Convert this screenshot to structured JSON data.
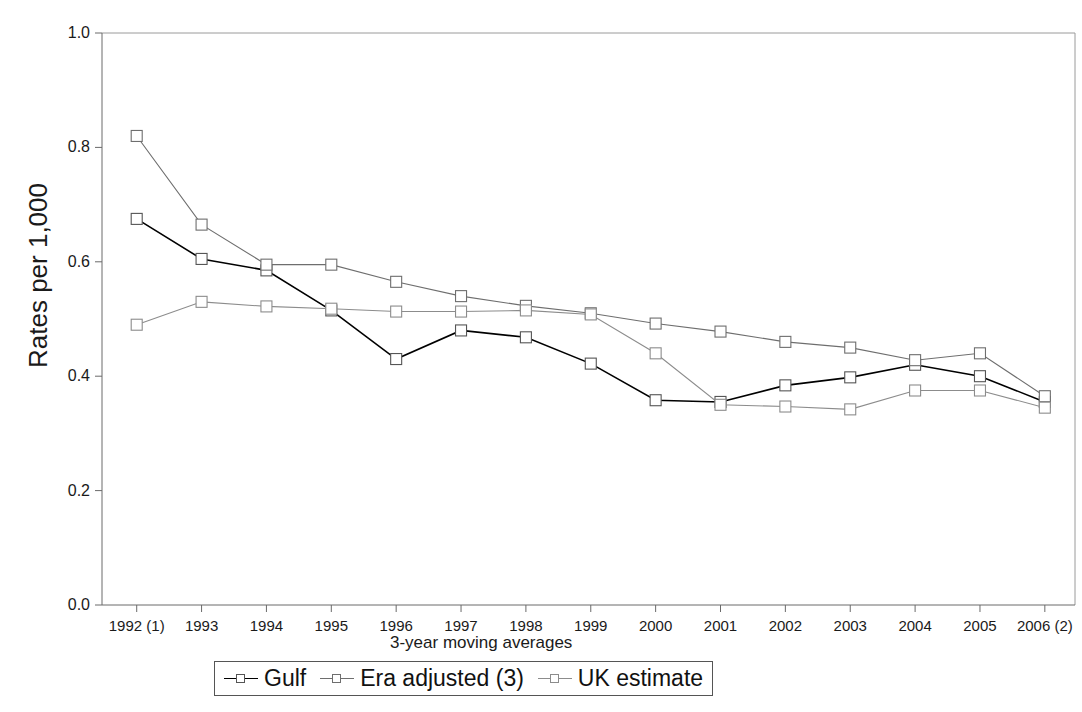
{
  "axes": {
    "ylabel": "Rates per 1,000",
    "xlabel": "3-year moving averages",
    "ytick_labels": [
      "1.0",
      "0.8",
      "0.6",
      "0.4",
      "0.2",
      "0.0"
    ],
    "xtick_labels": [
      "1992 (1)",
      "1993",
      "1994",
      "1995",
      "1996",
      "1997",
      "1998",
      "1999",
      "2000",
      "2001",
      "2002",
      "2003",
      "2004",
      "2005",
      "2006 (2)"
    ]
  },
  "legend": {
    "entries": [
      {
        "label": "Gulf",
        "color": "#000000"
      },
      {
        "label": "Era adjusted (3)",
        "color": "#6e6e6e"
      },
      {
        "label": "UK estimate",
        "color": "#8c8c8c"
      }
    ]
  },
  "title_fragment": "y",
  "chart_data": {
    "type": "line",
    "title": "",
    "xlabel": "3-year moving averages",
    "ylabel": "Rates per 1,000",
    "ylim": [
      0.0,
      1.0
    ],
    "yticks": [
      0.0,
      0.2,
      0.4,
      0.6,
      0.8,
      1.0
    ],
    "grid": false,
    "legend_position": "bottom",
    "categories": [
      "1992 (1)",
      "1993",
      "1994",
      "1995",
      "1996",
      "1997",
      "1998",
      "1999",
      "2000",
      "2001",
      "2002",
      "2003",
      "2004",
      "2005",
      "2006 (2)"
    ],
    "series": [
      {
        "name": "Gulf",
        "color": "#000000",
        "marker": "square-open",
        "values": [
          0.675,
          0.605,
          0.585,
          0.515,
          0.43,
          0.48,
          0.468,
          0.422,
          0.358,
          0.355,
          0.384,
          0.398,
          0.42,
          0.4,
          0.355
        ]
      },
      {
        "name": "Era adjusted (3)",
        "color": "#6e6e6e",
        "marker": "square-open",
        "values": [
          0.82,
          0.665,
          0.595,
          0.595,
          0.565,
          0.54,
          0.523,
          0.51,
          0.492,
          0.478,
          0.46,
          0.45,
          0.428,
          0.44,
          0.365
        ]
      },
      {
        "name": "UK estimate",
        "color": "#8c8c8c",
        "marker": "square-open",
        "values": [
          0.49,
          0.53,
          0.522,
          0.518,
          0.513,
          0.513,
          0.515,
          0.508,
          0.44,
          0.35,
          0.347,
          0.342,
          0.375,
          0.375,
          0.345
        ]
      }
    ]
  }
}
